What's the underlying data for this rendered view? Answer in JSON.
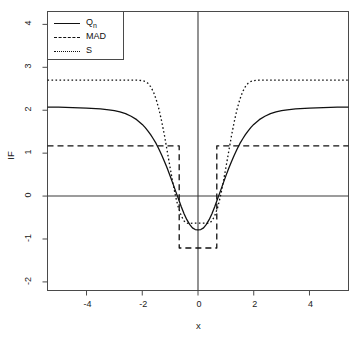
{
  "chart_data": {
    "type": "line",
    "title": "",
    "xlabel": "x",
    "ylabel": "IF",
    "xlim": [
      -5.4,
      5.4
    ],
    "ylim": [
      -2.2,
      4.3
    ],
    "xticks": [
      -4,
      -2,
      0,
      2,
      4
    ],
    "xtick_labels": [
      "-4",
      "-2",
      "0",
      "2",
      "4"
    ],
    "yticks": [
      -2,
      -1,
      0,
      1,
      2,
      3,
      4
    ],
    "ytick_labels": [
      "-2",
      "-1",
      "0",
      "1",
      "2",
      "3",
      "4"
    ],
    "grid": false,
    "legend_position": "top-left",
    "reference_lines": [
      {
        "type": "horizontal",
        "value": 0
      },
      {
        "type": "vertical",
        "value": 0
      }
    ],
    "series": [
      {
        "name": "Qn",
        "label_main": "Q",
        "label_sub": "n",
        "style": "solid",
        "color": "#111111",
        "plateau": 2.07,
        "minimum": -0.78,
        "x": [
          -5.4,
          -5.0,
          -4.5,
          -4.0,
          -3.5,
          -3.2,
          -3.0,
          -2.8,
          -2.6,
          -2.4,
          -2.2,
          -2.0,
          -1.9,
          -1.8,
          -1.7,
          -1.6,
          -1.5,
          -1.4,
          -1.3,
          -1.2,
          -1.1,
          -1.0,
          -0.9,
          -0.8,
          -0.7,
          -0.6,
          -0.5,
          -0.4,
          -0.3,
          -0.2,
          -0.1,
          0.0,
          0.1,
          0.2,
          0.3,
          0.4,
          0.5,
          0.6,
          0.7,
          0.8,
          0.9,
          1.0,
          1.1,
          1.2,
          1.3,
          1.4,
          1.5,
          1.6,
          1.7,
          1.8,
          1.9,
          2.0,
          2.2,
          2.4,
          2.6,
          2.8,
          3.0,
          3.2,
          3.5,
          4.0,
          4.5,
          5.0,
          5.4
        ],
        "y": [
          2.07,
          2.07,
          2.06,
          2.05,
          2.03,
          2.01,
          1.99,
          1.96,
          1.92,
          1.86,
          1.78,
          1.67,
          1.6,
          1.52,
          1.43,
          1.33,
          1.22,
          1.09,
          0.95,
          0.8,
          0.64,
          0.47,
          0.29,
          0.11,
          -0.07,
          -0.25,
          -0.41,
          -0.55,
          -0.66,
          -0.74,
          -0.78,
          -0.79,
          -0.78,
          -0.74,
          -0.66,
          -0.55,
          -0.41,
          -0.25,
          -0.07,
          0.11,
          0.29,
          0.47,
          0.64,
          0.8,
          0.95,
          1.09,
          1.22,
          1.33,
          1.43,
          1.52,
          1.6,
          1.67,
          1.78,
          1.86,
          1.92,
          1.96,
          1.99,
          2.01,
          2.03,
          2.05,
          2.06,
          2.07,
          2.07
        ]
      },
      {
        "name": "MAD",
        "label_main": "MAD",
        "label_sub": "",
        "style": "dashed",
        "color": "#111111",
        "plateau": 1.17,
        "minimum": -1.21,
        "step_edges": [
          -0.674,
          0.674
        ],
        "x": [
          -5.4,
          -0.675,
          -0.674,
          0.674,
          0.675,
          5.4
        ],
        "y": [
          1.17,
          1.17,
          -1.21,
          -1.21,
          1.17,
          1.17
        ]
      },
      {
        "name": "S",
        "label_main": "S",
        "label_sub": "",
        "style": "dotted",
        "color": "#111111",
        "plateau": 2.7,
        "minimum": -0.63,
        "x": [
          -5.4,
          -5.0,
          -4.5,
          -4.0,
          -3.5,
          -3.0,
          -2.5,
          -2.2,
          -2.0,
          -1.9,
          -1.8,
          -1.7,
          -1.6,
          -1.5,
          -1.4,
          -1.3,
          -1.2,
          -1.1,
          -1.0,
          -0.9,
          -0.8,
          -0.7,
          -0.6,
          -0.5,
          -0.4,
          -0.3,
          -0.2,
          -0.1,
          0.0,
          0.1,
          0.2,
          0.3,
          0.4,
          0.5,
          0.6,
          0.7,
          0.8,
          0.9,
          1.0,
          1.1,
          1.2,
          1.3,
          1.4,
          1.5,
          1.6,
          1.7,
          1.8,
          1.9,
          2.0,
          2.2,
          2.5,
          3.0,
          3.5,
          4.0,
          4.5,
          5.0,
          5.4
        ],
        "y": [
          2.7,
          2.7,
          2.7,
          2.7,
          2.7,
          2.7,
          2.7,
          2.7,
          2.69,
          2.67,
          2.63,
          2.55,
          2.43,
          2.25,
          2.02,
          1.73,
          1.4,
          1.03,
          0.66,
          0.3,
          -0.02,
          -0.28,
          -0.46,
          -0.58,
          -0.63,
          -0.64,
          -0.63,
          -0.63,
          -0.63,
          -0.63,
          -0.63,
          -0.64,
          -0.63,
          -0.58,
          -0.46,
          -0.28,
          -0.02,
          0.3,
          0.66,
          1.03,
          1.4,
          1.73,
          2.02,
          2.25,
          2.43,
          2.55,
          2.63,
          2.67,
          2.69,
          2.7,
          2.7,
          2.7,
          2.7,
          2.7,
          2.7,
          2.7,
          2.7
        ]
      }
    ]
  },
  "legend": {
    "items": [
      {
        "label_main": "Q",
        "label_sub": "n",
        "style": "solid"
      },
      {
        "label_main": "MAD",
        "label_sub": "",
        "style": "dashed"
      },
      {
        "label_main": "S",
        "label_sub": "",
        "style": "dotted"
      }
    ]
  }
}
